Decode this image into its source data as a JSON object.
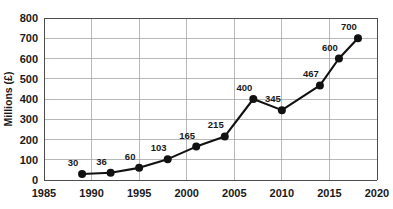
{
  "chart_data": {
    "type": "line",
    "title": "",
    "subtitle": "",
    "xlabel": "",
    "ylabel": "Millions (£)",
    "x": [
      1989,
      1992,
      1995,
      1998,
      2001,
      2004,
      2007,
      2010,
      2014,
      2016,
      2018
    ],
    "values": [
      30,
      36,
      60,
      103,
      165,
      215,
      400,
      345,
      467,
      600,
      700
    ],
    "point_labels": [
      "30",
      "36",
      "60",
      "103",
      "165",
      "215",
      "400",
      "345",
      "467",
      "600",
      "700"
    ],
    "series": [
      {
        "name": "Millions (£)",
        "values": [
          30,
          36,
          60,
          103,
          165,
          215,
          400,
          345,
          467,
          600,
          700
        ]
      }
    ],
    "xlim": [
      1985,
      2020
    ],
    "ylim": [
      0,
      800
    ],
    "x_ticks": [
      1985,
      1990,
      1995,
      2000,
      2005,
      2010,
      2015,
      2020
    ],
    "x_tick_labels": [
      "1985",
      "1990",
      "1995",
      "2000",
      "2005",
      "2010",
      "2015",
      "2020"
    ],
    "y_ticks": [
      0,
      100,
      200,
      300,
      400,
      500,
      600,
      700,
      800
    ],
    "y_tick_labels": [
      "0",
      "100",
      "200",
      "300",
      "400",
      "500",
      "600",
      "700",
      "800"
    ],
    "grid": {
      "horizontal": true,
      "vertical": true
    },
    "legend": {
      "visible": false,
      "position": "none"
    },
    "colors": {
      "line": "#111111",
      "marker": "#111111",
      "grid": "#9a9a9a",
      "axis": "#4d4d4d",
      "text": "#1a1a1a",
      "background": "#ffffff"
    },
    "marker": {
      "shape": "circle",
      "radius": 4
    }
  }
}
